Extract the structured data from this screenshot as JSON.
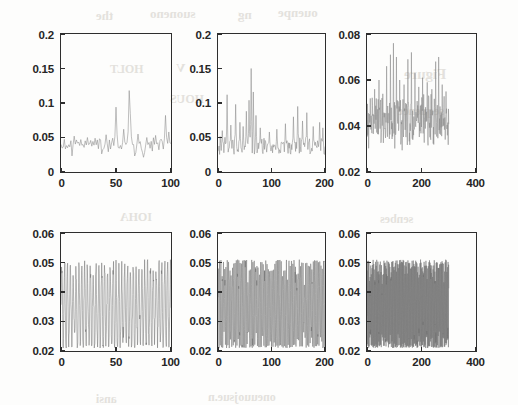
{
  "figure": {
    "kind": "multi-panel-time-series-figure",
    "rows": 2,
    "cols": 3,
    "background_color": "#fdfdfc",
    "axis_color": "#2e2e2e",
    "trace_color_sparse": "#8b8b8b",
    "trace_color_dense": "#6f6f6f"
  },
  "ghost_text": [
    {
      "text": "the",
      "x": 96,
      "y": 8,
      "size": 13
    },
    {
      "text": "suoneno",
      "x": 150,
      "y": 6,
      "size": 13
    },
    {
      "text": "ng",
      "x": 238,
      "y": 7,
      "size": 13
    },
    {
      "text": "ouenpe",
      "x": 278,
      "y": 5,
      "size": 13
    },
    {
      "text": "Figure",
      "x": 404,
      "y": 66,
      "size": 15
    },
    {
      "text": "sequence",
      "x": 398,
      "y": 104,
      "size": 12
    },
    {
      "text": "HOLT",
      "x": 110,
      "y": 62,
      "size": 12
    },
    {
      "text": "V",
      "x": 176,
      "y": 60,
      "size": 13
    },
    {
      "text": "HOUS",
      "x": 170,
      "y": 92,
      "size": 12
    },
    {
      "text": "IOHA",
      "x": 120,
      "y": 210,
      "size": 12
    },
    {
      "text": "senbes",
      "x": 380,
      "y": 212,
      "size": 12
    },
    {
      "text": "ansi",
      "x": 96,
      "y": 392,
      "size": 12
    },
    {
      "text": "oneuuojsue.n",
      "x": 208,
      "y": 390,
      "size": 12
    }
  ],
  "chart_data": [
    {
      "id": "panel-top-left",
      "type": "line",
      "title": "",
      "xlabel": "",
      "ylabel": "",
      "xlim": [
        0,
        100
      ],
      "ylim": [
        0,
        0.2
      ],
      "xticks": [
        0,
        50,
        100
      ],
      "xticklabels": [
        "0",
        "50",
        "100"
      ],
      "yticks": [
        0,
        0.05,
        0.1,
        0.15,
        0.2
      ],
      "yticklabels": [
        "0",
        "0.05",
        "0.1",
        "0.15",
        "0.2"
      ],
      "grid": false,
      "legend": null,
      "n_points": 100,
      "data_xmax": 100,
      "baseline": 0.035,
      "noise": 0.011,
      "spikes": [
        {
          "x": 12,
          "y": 0.052
        },
        {
          "x": 18,
          "y": 0.047
        },
        {
          "x": 24,
          "y": 0.05
        },
        {
          "x": 31,
          "y": 0.049
        },
        {
          "x": 41,
          "y": 0.054
        },
        {
          "x": 50,
          "y": 0.094
        },
        {
          "x": 57,
          "y": 0.062
        },
        {
          "x": 62,
          "y": 0.118
        },
        {
          "x": 63,
          "y": 0.085
        },
        {
          "x": 70,
          "y": 0.055
        },
        {
          "x": 78,
          "y": 0.05
        },
        {
          "x": 86,
          "y": 0.053
        },
        {
          "x": 95,
          "y": 0.082
        },
        {
          "x": 98,
          "y": 0.058
        }
      ]
    },
    {
      "id": "panel-top-middle",
      "type": "line",
      "title": "",
      "xlabel": "",
      "ylabel": "",
      "xlim": [
        0,
        200
      ],
      "ylim": [
        0,
        0.2
      ],
      "xticks": [
        0,
        100,
        200
      ],
      "xticklabels": [
        "0",
        "100",
        "200"
      ],
      "yticks": [
        0,
        0.05,
        0.1,
        0.15,
        0.2
      ],
      "yticklabels": [
        "0",
        "0.05",
        "0.1",
        "0.15",
        "0.2"
      ],
      "grid": false,
      "legend": null,
      "n_points": 200,
      "data_xmax": 200,
      "baseline": 0.037,
      "noise": 0.01,
      "spikes": [
        {
          "x": 8,
          "y": 0.06
        },
        {
          "x": 17,
          "y": 0.112
        },
        {
          "x": 24,
          "y": 0.068
        },
        {
          "x": 33,
          "y": 0.098
        },
        {
          "x": 41,
          "y": 0.072
        },
        {
          "x": 47,
          "y": 0.066
        },
        {
          "x": 53,
          "y": 0.088
        },
        {
          "x": 58,
          "y": 0.104
        },
        {
          "x": 62,
          "y": 0.15
        },
        {
          "x": 66,
          "y": 0.116
        },
        {
          "x": 71,
          "y": 0.082
        },
        {
          "x": 79,
          "y": 0.064
        },
        {
          "x": 96,
          "y": 0.058
        },
        {
          "x": 110,
          "y": 0.062
        },
        {
          "x": 126,
          "y": 0.07
        },
        {
          "x": 141,
          "y": 0.08
        },
        {
          "x": 149,
          "y": 0.095
        },
        {
          "x": 158,
          "y": 0.074
        },
        {
          "x": 166,
          "y": 0.086
        },
        {
          "x": 178,
          "y": 0.066
        },
        {
          "x": 190,
          "y": 0.072
        },
        {
          "x": 196,
          "y": 0.064
        }
      ]
    },
    {
      "id": "panel-top-right",
      "type": "line",
      "title": "",
      "xlabel": "",
      "ylabel": "",
      "xlim": [
        0,
        400
      ],
      "ylim": [
        0.02,
        0.08
      ],
      "xticks": [
        0,
        200,
        400
      ],
      "xticklabels": [
        "0",
        "200",
        "400"
      ],
      "yticks": [
        0.02,
        0.04,
        0.06,
        0.08
      ],
      "yticklabels": [
        "0.02",
        "0.04",
        "0.06",
        "0.08"
      ],
      "grid": false,
      "legend": null,
      "n_points": 300,
      "data_xmax": 300,
      "baseline": 0.041,
      "noise": 0.009,
      "spikes": [
        {
          "x": 12,
          "y": 0.052
        },
        {
          "x": 28,
          "y": 0.056
        },
        {
          "x": 44,
          "y": 0.06
        },
        {
          "x": 58,
          "y": 0.054
        },
        {
          "x": 72,
          "y": 0.066
        },
        {
          "x": 86,
          "y": 0.071
        },
        {
          "x": 97,
          "y": 0.076
        },
        {
          "x": 108,
          "y": 0.07
        },
        {
          "x": 120,
          "y": 0.06
        },
        {
          "x": 136,
          "y": 0.058
        },
        {
          "x": 150,
          "y": 0.069
        },
        {
          "x": 163,
          "y": 0.072
        },
        {
          "x": 176,
          "y": 0.063
        },
        {
          "x": 190,
          "y": 0.057
        },
        {
          "x": 204,
          "y": 0.061
        },
        {
          "x": 221,
          "y": 0.059
        },
        {
          "x": 238,
          "y": 0.056
        },
        {
          "x": 252,
          "y": 0.068
        },
        {
          "x": 263,
          "y": 0.07
        },
        {
          "x": 276,
          "y": 0.058
        },
        {
          "x": 290,
          "y": 0.055
        }
      ]
    },
    {
      "id": "panel-bottom-left",
      "type": "line",
      "title": "",
      "xlabel": "",
      "ylabel": "",
      "xlim": [
        0,
        100
      ],
      "ylim": [
        0.02,
        0.06
      ],
      "xticks": [
        0,
        50,
        100
      ],
      "xticklabels": [
        "0",
        "50",
        "100"
      ],
      "yticks": [
        0.02,
        0.03,
        0.04,
        0.05,
        0.06
      ],
      "yticklabels": [
        "0.02",
        "0.03",
        "0.04",
        "0.05",
        "0.06"
      ],
      "grid": false,
      "legend": null,
      "n_points": 100,
      "data_xmax": 100,
      "oscillation": {
        "low": 0.021,
        "high": 0.051,
        "mean": 0.035,
        "period": 2.6
      },
      "description": "dense high-frequency oscillation spanning nearly the full y-range"
    },
    {
      "id": "panel-bottom-middle",
      "type": "line",
      "title": "",
      "xlabel": "",
      "ylabel": "",
      "xlim": [
        0,
        200
      ],
      "ylim": [
        0.02,
        0.06
      ],
      "xticks": [
        0,
        100,
        200
      ],
      "xticklabels": [
        "0",
        "100",
        "200"
      ],
      "yticks": [
        0.02,
        0.03,
        0.04,
        0.05,
        0.06
      ],
      "yticklabels": [
        "0.02",
        "0.03",
        "0.04",
        "0.05",
        "0.06"
      ],
      "grid": false,
      "legend": null,
      "n_points": 200,
      "data_xmax": 200,
      "oscillation": {
        "low": 0.021,
        "high": 0.051,
        "mean": 0.035,
        "period": 2.4
      },
      "description": "dense high-frequency oscillation spanning nearly the full y-range"
    },
    {
      "id": "panel-bottom-right",
      "type": "line",
      "title": "",
      "xlabel": "",
      "ylabel": "",
      "xlim": [
        0,
        400
      ],
      "ylim": [
        0.02,
        0.06
      ],
      "xticks": [
        0,
        200,
        400
      ],
      "xticklabels": [
        "0",
        "200",
        "400"
      ],
      "yticks": [
        0.02,
        0.03,
        0.04,
        0.05,
        0.06
      ],
      "yticklabels": [
        "0.02",
        "0.03",
        "0.04",
        "0.05",
        "0.06"
      ],
      "grid": false,
      "legend": null,
      "n_points": 300,
      "data_xmax": 300,
      "oscillation": {
        "low": 0.021,
        "high": 0.051,
        "mean": 0.035,
        "period": 2.2
      },
      "description": "dense high-frequency oscillation, data ends near x=300 leaving right quarter blank"
    }
  ],
  "panels_geometry": [
    {
      "id": "panel-top-left",
      "left": 60,
      "top": 33,
      "width": 112,
      "height": 140
    },
    {
      "id": "panel-top-middle",
      "left": 217,
      "top": 33,
      "width": 109,
      "height": 140
    },
    {
      "id": "panel-top-right",
      "left": 366,
      "top": 33,
      "width": 111,
      "height": 140
    },
    {
      "id": "panel-bottom-left",
      "left": 60,
      "top": 232,
      "width": 112,
      "height": 120
    },
    {
      "id": "panel-bottom-middle",
      "left": 217,
      "top": 232,
      "width": 109,
      "height": 120
    },
    {
      "id": "panel-bottom-right",
      "left": 366,
      "top": 232,
      "width": 111,
      "height": 120
    }
  ]
}
